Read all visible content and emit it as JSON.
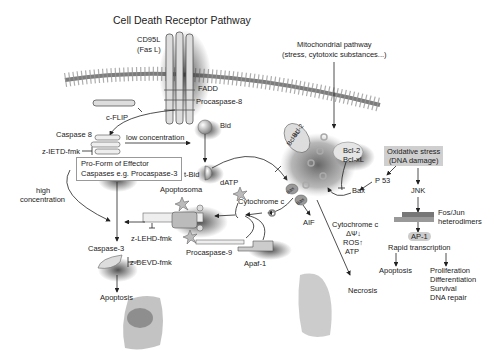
{
  "title": "Cell Death Receptor Pathway",
  "receptor": {
    "ligand": "CD95L",
    "ligand_alt": "(Fas L)",
    "adaptor": "FADD",
    "procaspase": "Procaspase-8"
  },
  "mito_pathway": {
    "line1": "Mitochondrial pathway",
    "line2": "(stress, cytotoxic substances...)"
  },
  "left": {
    "cflip": "c-FLIP",
    "caspase8": "Caspase 8",
    "inhibitor_ietd": "z-IETD-fmk",
    "low_conc": "low concentration",
    "proform_line1": "Pro-Form of Effector",
    "proform_line2": "Caspases e.g. Procaspase-3",
    "high_line1": "high",
    "high_line2": "concentration"
  },
  "bid": {
    "bid": "Bid",
    "tbid": "t-Bid"
  },
  "apoptosome": {
    "label": "Apoptosoma",
    "datp": "dATP",
    "cytc": "Cytochrome c",
    "lehd": "z-LEHD-fmk",
    "procasp9": "Procaspase-9",
    "apaf": "Apaf-1"
  },
  "caspase3": {
    "label": "Caspase-3",
    "devd": "z-DEVD-fmk",
    "apoptosis": "Apoptosis"
  },
  "mito": {
    "bcl_a": "Bcl-2",
    "bcl_b": "Bcl-xL",
    "bcl_top1": "Bcl-2",
    "bcl_top2": "Bcl-xL",
    "bax": "Bax",
    "p53": "P 53",
    "bax_bub1": "Bax",
    "bax_bub2": "Bax",
    "aif": "AIF"
  },
  "necrosis": {
    "line1": "Cytochrome c",
    "line2": "ΔΨ↓",
    "line3": "ROS↑",
    "line4": "ATP",
    "label": "Necrosis"
  },
  "oxidative": {
    "line1": "Oxidative stress",
    "line2": "(DNA damage)",
    "jnk": "JNK",
    "fosjun1": "Fos/Jun",
    "fosjun2": "heterodimers",
    "ap1": "AP-1",
    "rapid": "Rapid transcription",
    "apoptosis": "Apoptosis",
    "outcomes": [
      "Proliferation",
      "Differentiation",
      "Survival",
      "DNA repair"
    ]
  }
}
